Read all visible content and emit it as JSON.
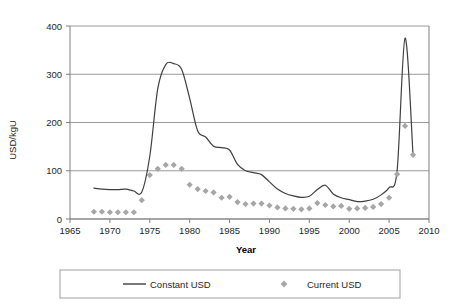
{
  "chart_data": {
    "type": "line",
    "title": "",
    "subtitle": "",
    "xlabel": "Year",
    "ylabel": "USD/kgU",
    "xlim": [
      1965,
      2010
    ],
    "ylim": [
      0,
      400
    ],
    "xticks": [
      1965,
      1970,
      1975,
      1980,
      1985,
      1990,
      1995,
      2000,
      2005,
      2010
    ],
    "yticks": [
      0,
      100,
      200,
      300,
      400
    ],
    "grid": "horizontal",
    "legend_position": "bottom",
    "series": [
      {
        "name": "Constant USD",
        "style": "line",
        "color": "#3f3f3f",
        "x": [
          1968,
          1969,
          1970,
          1971,
          1972,
          1973,
          1974,
          1975,
          1976,
          1977,
          1978,
          1979,
          1980,
          1981,
          1982,
          1983,
          1984,
          1985,
          1986,
          1987,
          1988,
          1989,
          1990,
          1991,
          1992,
          1993,
          1994,
          1995,
          1996,
          1997,
          1998,
          1999,
          2000,
          2001,
          2002,
          2003,
          2004,
          2005,
          2006,
          2007,
          2008
        ],
        "values": [
          64,
          62,
          61,
          61,
          62,
          58,
          56,
          130,
          270,
          320,
          322,
          310,
          250,
          183,
          170,
          151,
          148,
          143,
          113,
          100,
          96,
          92,
          77,
          62,
          53,
          48,
          45,
          47,
          61,
          70,
          52,
          44,
          40,
          36,
          37,
          41,
          50,
          65,
          100,
          375,
          133
        ]
      },
      {
        "name": "Current USD",
        "style": "markers",
        "color": "#a6a6a6",
        "x": [
          1968,
          1969,
          1970,
          1971,
          1972,
          1973,
          1974,
          1975,
          1976,
          1977,
          1978,
          1979,
          1980,
          1981,
          1982,
          1983,
          1984,
          1985,
          1986,
          1987,
          1988,
          1989,
          1990,
          1991,
          1992,
          1993,
          1994,
          1995,
          1996,
          1997,
          1998,
          1999,
          2000,
          2001,
          2002,
          2003,
          2004,
          2005,
          2006,
          2007,
          2008
        ],
        "values": [
          15,
          15,
          14,
          14,
          14,
          14,
          39,
          91,
          104,
          112,
          112,
          104,
          71,
          62,
          58,
          55,
          44,
          46,
          35,
          31,
          32,
          32,
          28,
          24,
          22,
          21,
          20,
          22,
          33,
          29,
          26,
          27,
          21,
          22,
          23,
          25,
          31,
          44,
          93,
          193,
          133
        ]
      }
    ]
  },
  "axis": {
    "y_title": "USD/kgU",
    "x_title": "Year",
    "y_labels": [
      "400",
      "300",
      "200",
      "100",
      "0"
    ],
    "x_labels": [
      "1965",
      "1970",
      "1975",
      "1980",
      "1985",
      "1990",
      "1995",
      "2000",
      "2005",
      "2010"
    ]
  },
  "legend": {
    "items": [
      {
        "label": "Constant USD",
        "marker": "line-swatch",
        "color": "#3f3f3f"
      },
      {
        "label": "Current USD",
        "marker": "diamond-swatch",
        "color": "#a6a6a6"
      }
    ]
  },
  "colors": {
    "line": "#3f3f3f",
    "marker": "#a6a6a6",
    "grid": "#808080",
    "axis": "#7f7f7f",
    "legend_border": "#a0a0a0",
    "background": "#ffffff"
  }
}
